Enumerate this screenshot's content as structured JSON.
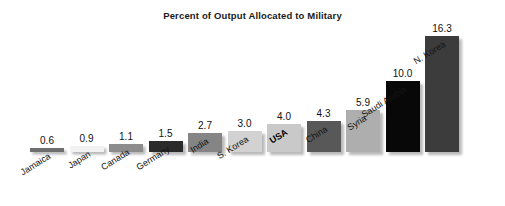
{
  "chart_data": {
    "type": "bar",
    "title": "Percent of Output Allocated to Military",
    "xlabel": "",
    "ylabel": "",
    "ylim": [
      0,
      17
    ],
    "grid": false,
    "legend": "none",
    "orientation": "vertical",
    "value_labels_shown": true,
    "axis_visible": false,
    "categories": [
      "Jamaica",
      "Japan",
      "Canada",
      "Germany",
      "India",
      "S. Korea",
      "USA",
      "China",
      "Syria",
      "Saudi Arabia",
      "N. Korea"
    ],
    "values": [
      0.6,
      0.9,
      1.1,
      1.5,
      2.7,
      3.0,
      4.0,
      4.3,
      5.9,
      10.0,
      16.3
    ],
    "value_label_text": [
      "0.6",
      "0.9",
      "1.1",
      "1.5",
      "2.7",
      "3.0",
      "4.0",
      "4.3",
      "5.9",
      "10.0",
      "16.3"
    ],
    "bar_colors": [
      "#6e6e6e",
      "#f2f2f2",
      "#8c8c8c",
      "#2b2b2b",
      "#858585",
      "#d2d2d2",
      "#c9c9c9",
      "#585858",
      "#aeaeae",
      "#080808",
      "#3c3c3c"
    ],
    "highlighted_category": "USA",
    "units": "percent"
  },
  "meta": {
    "background_color": "#ffffff",
    "title_color": "#1a1a1a",
    "label_color": "#141414",
    "value_color": "#111111"
  }
}
